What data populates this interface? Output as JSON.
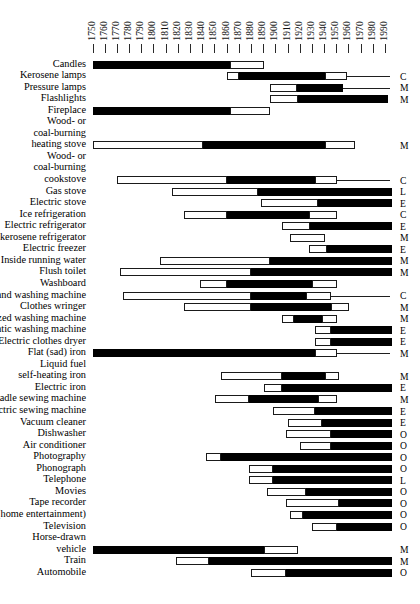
{
  "chart_data": {
    "type": "bar",
    "title": "",
    "subtitle": "",
    "xlabel": "",
    "ylabel": "",
    "xlim": [
      1750,
      1995
    ],
    "grid": false,
    "legend_position": "none",
    "axis": {
      "ticks": [
        1750,
        1760,
        1770,
        1780,
        1790,
        1800,
        1810,
        1820,
        1830,
        1840,
        1850,
        1860,
        1870,
        1880,
        1890,
        1900,
        1910,
        1920,
        1930,
        1940,
        1950,
        1960,
        1970,
        1980,
        1990
      ],
      "tick_labels": [
        "1750",
        "1760",
        "1770",
        "1780",
        "1790",
        "1800",
        "1810",
        "1820",
        "1830",
        "1840",
        "1850",
        "1860",
        "1870",
        "1880",
        "1890",
        "1900",
        "1910",
        "1920",
        "1930",
        "1940",
        "1950",
        "1960",
        "1970",
        "1980",
        "1990"
      ]
    },
    "segment_legend": {
      "open": "introduction",
      "solid": "diffusion"
    },
    "category_codes": [
      "C",
      "M",
      "E",
      "L",
      "O"
    ],
    "rows": [
      {
        "label": [
          "Candles"
        ],
        "intro": null,
        "diff": [
          1750,
          1862
        ],
        "tail": [
          1862,
          1890
        ],
        "code": "",
        "baseline": false
      },
      {
        "label": [
          "Kerosene lamps"
        ],
        "intro": [
          1860,
          1870
        ],
        "diff": [
          1870,
          1940
        ],
        "tail": [
          1940,
          1958
        ],
        "code": "C",
        "baseline": true
      },
      {
        "label": [
          "Pressure lamps"
        ],
        "intro": [
          1895,
          1917
        ],
        "diff": [
          1917,
          1955
        ],
        "tail": null,
        "code": "M",
        "baseline": true
      },
      {
        "label": [
          "Flashlights"
        ],
        "intro": [
          1895,
          1918
        ],
        "diff": [
          1918,
          1992
        ],
        "tail": null,
        "code": "M",
        "baseline": false
      },
      {
        "label": [
          "Fireplace"
        ],
        "intro": null,
        "diff": [
          1750,
          1862
        ],
        "tail": [
          1862,
          1895
        ],
        "code": "",
        "baseline": false
      },
      {
        "label": [
          "Wood- or",
          "coal-burning",
          "heating stove"
        ],
        "intro": [
          1750,
          1840
        ],
        "diff": [
          1840,
          1940
        ],
        "tail": [
          1940,
          1965
        ],
        "code": "M",
        "baseline": false
      },
      {
        "label": [
          "Wood- or",
          "coal-burning",
          "cookstove"
        ],
        "intro": [
          1770,
          1860
        ],
        "diff": [
          1860,
          1932
        ],
        "tail": [
          1932,
          1950
        ],
        "code": "C",
        "baseline": true
      },
      {
        "label": [
          "Gas stove"
        ],
        "intro": [
          1815,
          1885
        ],
        "diff": [
          1885,
          1995
        ],
        "tail": null,
        "code": "L",
        "baseline": false
      },
      {
        "label": [
          "Electric stove"
        ],
        "intro": [
          1888,
          1935
        ],
        "diff": [
          1935,
          1995
        ],
        "tail": null,
        "code": "E",
        "baseline": false
      },
      {
        "label": [
          "Ice refrigeration"
        ],
        "intro": [
          1825,
          1860
        ],
        "diff": [
          1860,
          1927
        ],
        "tail": [
          1927,
          1950
        ],
        "code": "C",
        "baseline": false
      },
      {
        "label": [
          "Electric refrigerator"
        ],
        "intro": [
          1905,
          1928
        ],
        "diff": [
          1928,
          1995
        ],
        "tail": null,
        "code": "E",
        "baseline": false
      },
      {
        "label": [
          "Gas & kerosene refrigerator"
        ],
        "intro": [
          1912,
          1940
        ],
        "diff": null,
        "tail": null,
        "code": "M",
        "baseline": false
      },
      {
        "label": [
          "Electric freezer"
        ],
        "intro": [
          1927,
          1942
        ],
        "diff": [
          1942,
          1995
        ],
        "tail": null,
        "code": "E",
        "baseline": false
      },
      {
        "label": [
          "Inside running water"
        ],
        "intro": [
          1805,
          1895
        ],
        "diff": [
          1895,
          1995
        ],
        "tail": null,
        "code": "M",
        "baseline": false
      },
      {
        "label": [
          "Flush toilet"
        ],
        "intro": [
          1772,
          1880
        ],
        "diff": [
          1880,
          1995
        ],
        "tail": null,
        "code": "M",
        "baseline": false
      },
      {
        "label": [
          "Washboard"
        ],
        "intro": [
          1838,
          1860
        ],
        "diff": [
          1860,
          1930
        ],
        "tail": [
          1930,
          1950
        ],
        "code": "",
        "baseline": false
      },
      {
        "label": [
          "Hand washing machine"
        ],
        "intro": [
          1775,
          1880
        ],
        "diff": [
          1880,
          1925
        ],
        "tail": [
          1925,
          1945
        ],
        "code": "C",
        "baseline": true
      },
      {
        "label": [
          "Clothes wringer"
        ],
        "intro": [
          1825,
          1880
        ],
        "diff": [
          1880,
          1945
        ],
        "tail": [
          1945,
          1960
        ],
        "code": "M",
        "baseline": false
      },
      {
        "label": [
          "Motorized washing machine"
        ],
        "intro": [
          1905,
          1915
        ],
        "diff": [
          1915,
          1938
        ],
        "tail": [
          1938,
          1950
        ],
        "code": "M",
        "baseline": false
      },
      {
        "label": [
          "Automatic washing machine"
        ],
        "intro": [
          1932,
          1945
        ],
        "diff": [
          1945,
          1995
        ],
        "tail": null,
        "code": "E",
        "baseline": false
      },
      {
        "label": [
          "Electric clothes dryer"
        ],
        "intro": [
          1932,
          1945
        ],
        "diff": [
          1945,
          1995
        ],
        "tail": null,
        "code": "E",
        "baseline": false
      },
      {
        "label": [
          "Flat (sad) iron"
        ],
        "intro": null,
        "diff": [
          1750,
          1932
        ],
        "tail": [
          1932,
          1950
        ],
        "code": "M",
        "baseline": true
      },
      {
        "label": [
          "Liquid fuel",
          "self-heating iron"
        ],
        "intro": [
          1855,
          1905
        ],
        "diff": [
          1905,
          1940
        ],
        "tail": [
          1940,
          1952
        ],
        "code": "M",
        "baseline": false
      },
      {
        "label": [
          "Electric iron"
        ],
        "intro": [
          1890,
          1905
        ],
        "diff": [
          1905,
          1995
        ],
        "tail": null,
        "code": "E",
        "baseline": false
      },
      {
        "label": [
          "Treadle sewing machine"
        ],
        "intro": [
          1850,
          1878
        ],
        "diff": [
          1878,
          1935
        ],
        "tail": [
          1935,
          1950
        ],
        "code": "M",
        "baseline": false
      },
      {
        "label": [
          "Electric sewing machine"
        ],
        "intro": [
          1898,
          1932
        ],
        "diff": [
          1932,
          1995
        ],
        "tail": null,
        "code": "E",
        "baseline": false
      },
      {
        "label": [
          "Vacuum cleaner"
        ],
        "intro": [
          1910,
          1938
        ],
        "diff": [
          1938,
          1995
        ],
        "tail": null,
        "code": "E",
        "baseline": false
      },
      {
        "label": [
          "Dishwasher"
        ],
        "intro": [
          1908,
          1945
        ],
        "diff": [
          1945,
          1995
        ],
        "tail": null,
        "code": "O",
        "baseline": false
      },
      {
        "label": [
          "Air conditioner"
        ],
        "intro": [
          1920,
          1945
        ],
        "diff": [
          1945,
          1995
        ],
        "tail": null,
        "code": "O",
        "baseline": false
      },
      {
        "label": [
          "Photography"
        ],
        "intro": [
          1843,
          1855
        ],
        "diff": [
          1855,
          1995
        ],
        "tail": null,
        "code": "O",
        "baseline": false
      },
      {
        "label": [
          "Phonograph"
        ],
        "intro": [
          1878,
          1898
        ],
        "diff": [
          1898,
          1995
        ],
        "tail": null,
        "code": "O",
        "baseline": false
      },
      {
        "label": [
          "Telephone"
        ],
        "intro": [
          1878,
          1898
        ],
        "diff": [
          1898,
          1995
        ],
        "tail": null,
        "code": "L",
        "baseline": false
      },
      {
        "label": [
          "Movies"
        ],
        "intro": [
          1893,
          1925
        ],
        "diff": [
          1925,
          1995
        ],
        "tail": null,
        "code": "O",
        "baseline": false
      },
      {
        "label": [
          "Tape recorder"
        ],
        "intro": [
          1908,
          1952
        ],
        "diff": [
          1952,
          1995
        ],
        "tail": null,
        "code": "O",
        "baseline": false
      },
      {
        "label": [
          "Radio (home entertainment)"
        ],
        "intro": [
          1912,
          1922
        ],
        "diff": [
          1922,
          1995
        ],
        "tail": null,
        "code": "O",
        "baseline": false
      },
      {
        "label": [
          "Television"
        ],
        "intro": [
          1930,
          1950
        ],
        "diff": [
          1950,
          1995
        ],
        "tail": null,
        "code": "O",
        "baseline": false
      },
      {
        "label": [
          "Horse-drawn",
          "vehicle"
        ],
        "intro": null,
        "diff": [
          1750,
          1890
        ],
        "tail": [
          1890,
          1918
        ],
        "code": "M",
        "baseline": false
      },
      {
        "label": [
          "Train"
        ],
        "intro": [
          1818,
          1845
        ],
        "diff": [
          1845,
          1995
        ],
        "tail": null,
        "code": "M",
        "baseline": false
      },
      {
        "label": [
          "Automobile"
        ],
        "intro": [
          1880,
          1908
        ],
        "diff": [
          1908,
          1995
        ],
        "tail": null,
        "code": "O",
        "baseline": false
      }
    ]
  }
}
